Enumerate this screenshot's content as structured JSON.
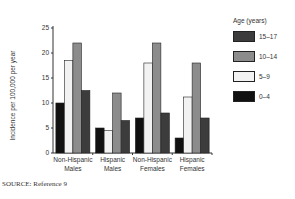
{
  "chart_data": {
    "type": "bar",
    "title": "",
    "xlabel": "",
    "ylabel": "Incidence per 100,000 per year",
    "ylim": [
      0,
      25
    ],
    "yticks": [
      0,
      5,
      10,
      15,
      20,
      25
    ],
    "grid": false,
    "legend_title": "Age (years)",
    "legend_position": "right",
    "categories": [
      "Non-Hispanic Males",
      "Hispanic Males",
      "Non-Hispanic Females",
      "Hispanic Females"
    ],
    "category_lines": [
      [
        "Non-Hispanic",
        "Males"
      ],
      [
        "Hispanic",
        "Males"
      ],
      [
        "Non-Hispanic",
        "Females"
      ],
      [
        "Hispanic",
        "Females"
      ]
    ],
    "series": [
      {
        "name": "0–4",
        "color": "#111111",
        "values": [
          10,
          5,
          7,
          3
        ]
      },
      {
        "name": "5–9",
        "color": "#f2f2f2",
        "values": [
          18.5,
          4.5,
          18,
          11.2
        ]
      },
      {
        "name": "10–14",
        "color": "#8c8c8c",
        "values": [
          22,
          12,
          22,
          18
        ]
      },
      {
        "name": "15–17",
        "color": "#3c3c3c",
        "values": [
          12.5,
          6.5,
          8,
          7
        ]
      }
    ],
    "legend_order": [
      "15–17",
      "10–14",
      "5–9",
      "0–4"
    ]
  },
  "source_note": "SOURCE:  Reference 9"
}
